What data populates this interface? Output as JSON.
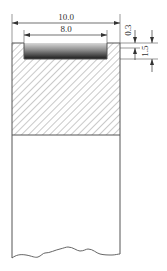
{
  "drawing": {
    "title": "Section view with recess",
    "dimensions": {
      "overall_width": "10.0",
      "recess_width": "8.0",
      "recess_depth": "0.3",
      "layer_depth": "1.5"
    },
    "colors": {
      "line": "#555555",
      "hatch": "#777777",
      "recess_dark": "#1a1a1a",
      "recess_light": "#d8d8d8",
      "background": "#ffffff"
    }
  }
}
